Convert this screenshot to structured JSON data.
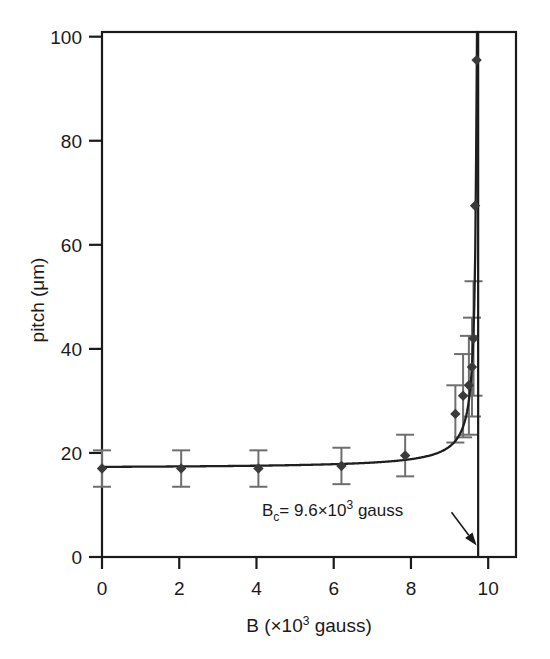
{
  "chart_data": {
    "type": "scatter",
    "title": "",
    "xlabel": "B (×10³ gauss)",
    "ylabel": "pitch (μm)",
    "xlabel_parts": {
      "main": "B (×10",
      "sup": "3",
      "tail": " gauss)"
    },
    "ylabel_text": "pitch (μm)",
    "xlim": [
      0,
      10.72
    ],
    "ylim": [
      0,
      100.9
    ],
    "xticks": [
      0,
      2,
      4,
      6,
      8,
      10
    ],
    "xtick_labels": [
      "0",
      "2",
      "4",
      "6",
      "8",
      "10"
    ],
    "yticks": [
      0,
      20,
      40,
      60,
      80,
      100
    ],
    "ytick_labels": [
      "0",
      "20",
      "40",
      "60",
      "80",
      "100"
    ],
    "grid": false,
    "legend": "none",
    "marker": "diamond",
    "marker_color": "#3a3a3a",
    "errorbar_color": "#6e6e6e",
    "curve_color": "#1f1f1f",
    "series": [
      {
        "name": "pitch vs B",
        "x": [
          0.0,
          2.05,
          4.05,
          6.2,
          7.85,
          9.15,
          9.35,
          9.5,
          9.58,
          9.62,
          9.66,
          9.7
        ],
        "y": [
          17.0,
          17.0,
          17.0,
          17.5,
          19.5,
          27.5,
          31.0,
          33.0,
          36.5,
          42.0,
          67.5,
          95.5
        ],
        "yerr": [
          3.5,
          3.5,
          3.5,
          3.5,
          4.0,
          5.5,
          8.0,
          9.5,
          9.5,
          11.0,
          0.0,
          0.0
        ]
      }
    ],
    "asymptote": {
      "x": 9.74,
      "label": "B_c",
      "style": "solid"
    },
    "annotation": {
      "text": "B_c= 9.6×10³ gauss",
      "parts": {
        "b": "B",
        "sub": "c",
        "eq": "= 9.6×10",
        "sup": "3",
        "tail": " gauss"
      },
      "arrow": {
        "from_x": 9.05,
        "from_y": 8.6,
        "to_x": 9.7,
        "to_y": 2.2
      },
      "value": 9.6,
      "units": "gauss"
    },
    "fit_curve_note": "divergent fit curve approaching vertical asymptote near B_c"
  },
  "figure": {
    "background": "#ffffff",
    "axis_color": "#1a1a1a",
    "plot_box": {
      "left": 102,
      "right": 516,
      "top": 32,
      "bottom": 557
    }
  }
}
